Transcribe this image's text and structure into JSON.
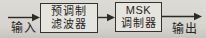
{
  "diagram": {
    "input_label": "输入",
    "output_label": "输出",
    "blocks": [
      {
        "id": "premod-filter",
        "line1": "预调制",
        "line2": "滤波器"
      },
      {
        "id": "msk-modulator",
        "line1": "MSK",
        "line2": "调制器"
      }
    ],
    "colors": {
      "background": "#d5d4cf",
      "box_fill": "#e5e4df",
      "line": "#2c2a25",
      "text": "#27251f"
    }
  }
}
